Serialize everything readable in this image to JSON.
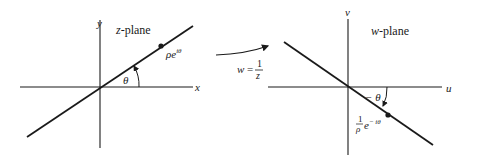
{
  "z_plane": {
    "title": "z-plane",
    "title_var": "z",
    "title_suffix": "-plane",
    "x_axis_label": "x",
    "y_axis_label": "y",
    "point_label_base": "ρe",
    "point_label_exp": "iθ",
    "angle_label": "θ"
  },
  "mapping": {
    "lhs": "w =",
    "numerator": "1",
    "denominator": "z"
  },
  "w_plane": {
    "title_var": "w",
    "title_suffix": "-plane",
    "u_axis_label": "u",
    "v_axis_label": "v",
    "point_label_num": "1",
    "point_label_den": "ρ",
    "point_label_base": "e",
    "point_label_exp": "− iθ",
    "angle_label": "− θ"
  },
  "colors": {
    "ink": "#1a1a1a",
    "background": "#ffffff"
  }
}
